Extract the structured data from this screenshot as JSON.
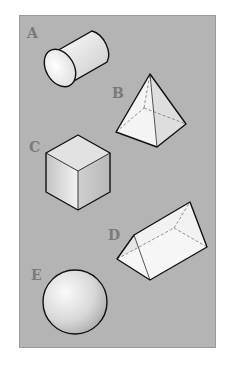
{
  "figure": {
    "background_color": "#b4b4b4",
    "shapes": [
      {
        "label": "A",
        "name": "cylinder"
      },
      {
        "label": "B",
        "name": "square pyramid"
      },
      {
        "label": "C",
        "name": "cube"
      },
      {
        "label": "D",
        "name": "triangular prism"
      },
      {
        "label": "E",
        "name": "sphere"
      }
    ]
  }
}
